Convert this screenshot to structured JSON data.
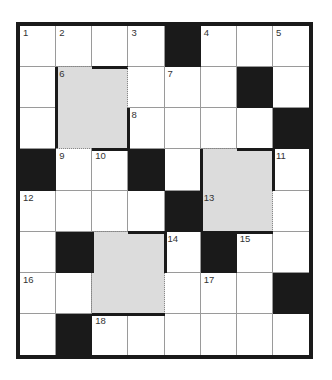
{
  "puzzle": {
    "type": "crossword",
    "cols": 8,
    "rows": 8,
    "colors": {
      "block": "#1a1a1a",
      "shaded": "#dcdcdc",
      "cell": "#ffffff",
      "grid_line": "#9a9a9a"
    },
    "grid": [
      [
        "1",
        "2",
        "",
        "3",
        "#",
        "4",
        "",
        "5"
      ],
      [
        "",
        "6",
        "",
        ".",
        "7",
        "",
        "#",
        ""
      ],
      [
        "",
        "",
        "",
        "8",
        "",
        "",
        "",
        "#"
      ],
      [
        "#",
        "9",
        "10",
        "#",
        "",
        "",
        "",
        "11"
      ],
      [
        "12",
        "",
        "",
        "",
        "#",
        "13",
        "",
        ""
      ],
      [
        "",
        "#",
        "",
        "",
        "14",
        "#",
        "15",
        ""
      ],
      [
        "16",
        "",
        "",
        "",
        "",
        "17",
        "",
        "#"
      ],
      [
        "",
        "#",
        "18",
        "",
        "",
        "",
        "",
        ""
      ]
    ],
    "shaded": [
      [
        1,
        1
      ],
      [
        1,
        2
      ],
      [
        2,
        1
      ],
      [
        2,
        2
      ],
      [
        3,
        5
      ],
      [
        3,
        6
      ],
      [
        4,
        5
      ],
      [
        4,
        6
      ],
      [
        5,
        2
      ],
      [
        5,
        3
      ],
      [
        6,
        2
      ],
      [
        6,
        3
      ]
    ],
    "numbers": [
      {
        "n": "1",
        "r": 0,
        "c": 0
      },
      {
        "n": "2",
        "r": 0,
        "c": 1
      },
      {
        "n": "3",
        "r": 0,
        "c": 3
      },
      {
        "n": "4",
        "r": 0,
        "c": 5
      },
      {
        "n": "5",
        "r": 0,
        "c": 7
      },
      {
        "n": "6",
        "r": 1,
        "c": 1
      },
      {
        "n": "7",
        "r": 1,
        "c": 4
      },
      {
        "n": "8",
        "r": 2,
        "c": 3
      },
      {
        "n": "9",
        "r": 3,
        "c": 1
      },
      {
        "n": "10",
        "r": 3,
        "c": 2
      },
      {
        "n": "11",
        "r": 3,
        "c": 7
      },
      {
        "n": "12",
        "r": 4,
        "c": 0
      },
      {
        "n": "13",
        "r": 4,
        "c": 5
      },
      {
        "n": "14",
        "r": 5,
        "c": 4
      },
      {
        "n": "15",
        "r": 5,
        "c": 6
      },
      {
        "n": "16",
        "r": 6,
        "c": 0
      },
      {
        "n": "17",
        "r": 6,
        "c": 5
      },
      {
        "n": "18",
        "r": 7,
        "c": 2
      }
    ],
    "blocks": [
      [
        0,
        4
      ],
      [
        1,
        6
      ],
      [
        2,
        7
      ],
      [
        3,
        0
      ],
      [
        3,
        3
      ],
      [
        4,
        4
      ],
      [
        5,
        1
      ],
      [
        5,
        5
      ],
      [
        6,
        7
      ],
      [
        7,
        1
      ]
    ]
  }
}
